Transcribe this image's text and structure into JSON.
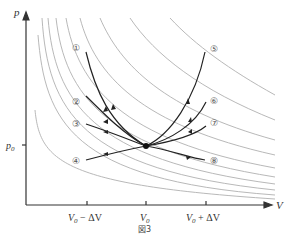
{
  "figure": {
    "caption": "図3",
    "axes": {
      "x_label": "V",
      "y_label": "p",
      "y_tick": "p0",
      "x_ticks": [
        "V0 − ΔV",
        "V0",
        "V0 + ΔV"
      ]
    },
    "curve_labels": [
      "①",
      "②",
      "③",
      "④",
      "⑤",
      "⑥",
      "⑦",
      "⑧"
    ],
    "center_point": "(V0, p0)",
    "background_curves": "family of gray isotherm/adiabat-like hyperbolas",
    "colors": {
      "process_curves": "#222222",
      "background_curves": "#aaaaaa",
      "axes": "#333333"
    }
  },
  "footer_text": "（以下の文章は画像の下端で切れて判読不能）"
}
